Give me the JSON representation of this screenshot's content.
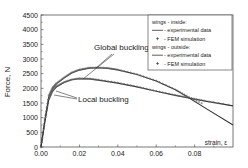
{
  "chart_data": {
    "type": "line",
    "title": "",
    "xlabel": "strain, ε",
    "ylabel": "Force, N",
    "xlim": [
      0,
      0.1
    ],
    "ylim": [
      0,
      4500
    ],
    "xticks": [
      0.0,
      0.02,
      0.04,
      0.06,
      0.08
    ],
    "xtick_labels": [
      "0.00",
      "0.02",
      "0.04",
      "0.06",
      "0.08"
    ],
    "yticks": [
      0,
      500,
      1000,
      1500,
      2000,
      2500,
      3000,
      3500,
      4000,
      4500
    ],
    "ytick_labels": [
      "0",
      "500",
      "1000",
      "1500",
      "2000",
      "2500",
      "3000",
      "3500",
      "4000",
      "4500"
    ],
    "grid": false,
    "legend": {
      "placement": "top-right",
      "entries": [
        {
          "text": "wings - inside:",
          "kind": "header"
        },
        {
          "text": "- experimental data",
          "kind": "line"
        },
        {
          "text": "- FEM simulation",
          "kind": "marker"
        },
        {
          "text": "wings - outside:",
          "kind": "header"
        },
        {
          "text": "- experimental data",
          "kind": "line"
        },
        {
          "text": "- FEM simulation",
          "kind": "marker"
        }
      ]
    },
    "annotations": [
      {
        "text": "Global buckling",
        "target_strain": [
          0.028,
          0.022
        ],
        "target_force": [
          2700,
          2330
        ]
      },
      {
        "text": "Local buckling",
        "target_strain": [
          0.007,
          0.006
        ],
        "target_force": [
          1950,
          1850
        ]
      }
    ],
    "series": [
      {
        "name": "wings - inside: experimental data",
        "style": "line",
        "x": [
          0,
          0.002,
          0.004,
          0.006,
          0.008,
          0.012,
          0.016,
          0.02,
          0.025,
          0.03,
          0.035,
          0.04,
          0.05,
          0.06,
          0.07,
          0.077,
          0.085,
          0.1
        ],
        "y": [
          0,
          900,
          1700,
          2000,
          2150,
          2350,
          2520,
          2620,
          2690,
          2700,
          2680,
          2630,
          2470,
          2250,
          1950,
          1680,
          1350,
          750
        ]
      },
      {
        "name": "wings - inside: FEM simulation",
        "style": "marker",
        "x": [
          0,
          0.002,
          0.004,
          0.006,
          0.008,
          0.012,
          0.016,
          0.02,
          0.025,
          0.03,
          0.035,
          0.04,
          0.05,
          0.06,
          0.07,
          0.077,
          0.085
        ],
        "y": [
          0,
          950,
          1750,
          2020,
          2170,
          2370,
          2540,
          2640,
          2700,
          2710,
          2690,
          2640,
          2480,
          2260,
          1960,
          1700,
          1450
        ]
      },
      {
        "name": "wings - outside: experimental data",
        "style": "line",
        "x": [
          0,
          0.002,
          0.004,
          0.006,
          0.008,
          0.012,
          0.016,
          0.02,
          0.025,
          0.03,
          0.04,
          0.05,
          0.06,
          0.07,
          0.077,
          0.085,
          0.1
        ],
        "y": [
          0,
          850,
          1600,
          1900,
          2050,
          2200,
          2290,
          2330,
          2320,
          2280,
          2180,
          2050,
          1900,
          1760,
          1670,
          1570,
          1400
        ]
      },
      {
        "name": "wings - outside: FEM simulation",
        "style": "marker",
        "x": [
          0,
          0.002,
          0.004,
          0.006,
          0.008,
          0.012,
          0.016,
          0.02,
          0.025,
          0.03,
          0.04,
          0.05,
          0.06,
          0.07,
          0.077,
          0.085,
          0.1
        ],
        "y": [
          0,
          880,
          1620,
          1920,
          2070,
          2210,
          2300,
          2340,
          2330,
          2290,
          2190,
          2060,
          1910,
          1770,
          1680,
          1580,
          1410
        ]
      }
    ]
  }
}
